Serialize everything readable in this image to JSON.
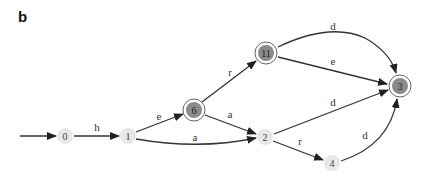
{
  "figure": {
    "panel_label": "b"
  },
  "nodes": [
    {
      "id": "0",
      "label": "0",
      "x": 65,
      "y": 136,
      "final": false
    },
    {
      "id": "1",
      "label": "1",
      "x": 128,
      "y": 136,
      "final": false
    },
    {
      "id": "6",
      "label": "6",
      "x": 194,
      "y": 110,
      "final": true
    },
    {
      "id": "11",
      "label": "11",
      "x": 266,
      "y": 53,
      "final": true
    },
    {
      "id": "2",
      "label": "2",
      "x": 265,
      "y": 137,
      "final": false
    },
    {
      "id": "3",
      "label": "3",
      "x": 400,
      "y": 86,
      "final": true
    },
    {
      "id": "4",
      "label": "4",
      "x": 332,
      "y": 163,
      "final": false
    }
  ],
  "edges": [
    {
      "from": "start",
      "to": "0",
      "label": ""
    },
    {
      "from": "0",
      "to": "1",
      "label": "h"
    },
    {
      "from": "1",
      "to": "6",
      "label": "e"
    },
    {
      "from": "1",
      "to": "2",
      "label": "a"
    },
    {
      "from": "6",
      "to": "11",
      "label": "r"
    },
    {
      "from": "6",
      "to": "2",
      "label": "a"
    },
    {
      "from": "11",
      "to": "3",
      "label": "d",
      "curve": "upper"
    },
    {
      "from": "11",
      "to": "3",
      "label": "e"
    },
    {
      "from": "2",
      "to": "3",
      "label": "d"
    },
    {
      "from": "2",
      "to": "4",
      "label": "r"
    },
    {
      "from": "4",
      "to": "3",
      "label": "d"
    }
  ],
  "colors": {
    "edge": "#333333",
    "node_fill": "#e8e8e8",
    "final_fill": "#8a8a8a"
  }
}
